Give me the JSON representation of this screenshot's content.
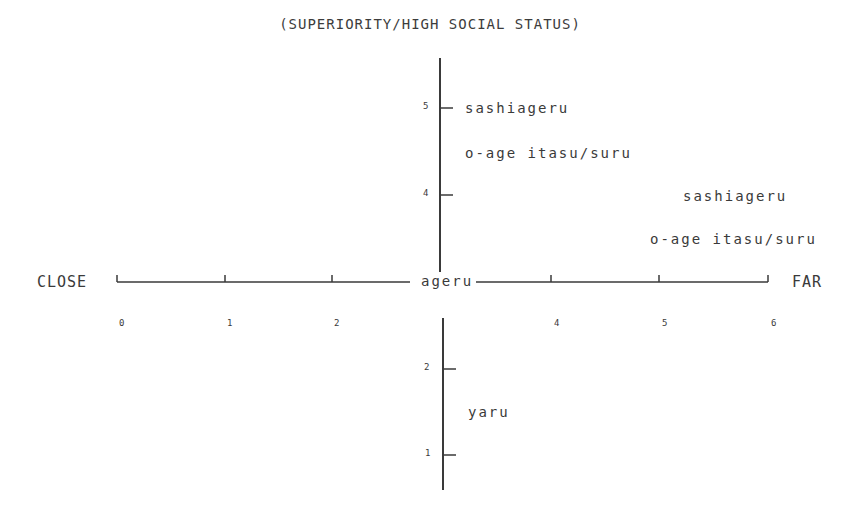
{
  "title": "(SUPERIORITY/HIGH SOCIAL STATUS)",
  "horizontal_axis": {
    "left_label": "CLOSE",
    "right_label": "FAR",
    "center_label": "ageru",
    "ticks": [
      "0",
      "1",
      "2",
      "4",
      "5",
      "6"
    ]
  },
  "vertical_axis": {
    "ticks_upper": [
      "5",
      "4"
    ],
    "ticks_lower": [
      "2",
      "1"
    ]
  },
  "labels": {
    "upper_sashiageru": "sashiageru",
    "upper_oage": "o-age itasu/suru",
    "right_sashiageru": "sashiageru",
    "right_oage": "o-age itasu/suru",
    "yaru": "yaru"
  },
  "colors": {
    "ink": "#3a3a3a",
    "background": "#ffffff"
  }
}
